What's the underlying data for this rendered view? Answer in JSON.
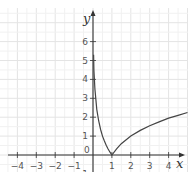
{
  "chart_data": {
    "type": "line",
    "title": "",
    "xlabel": "x",
    "ylabel": "y",
    "xlim": [
      -4.9,
      5.0
    ],
    "ylim": [
      -1.3,
      7.1
    ],
    "grid": true,
    "x_ticks": [
      "-4",
      "-3",
      "-2",
      "-1",
      "1",
      "2",
      "3",
      "4"
    ],
    "y_ticks": [
      "-1",
      "1",
      "2",
      "3",
      "4",
      "5",
      "6"
    ],
    "origin_label": "0",
    "series": [
      {
        "name": "y = |ln x|",
        "x": [
          0.03,
          0.05,
          0.1,
          0.2,
          0.3,
          0.4,
          0.5,
          0.6,
          0.7,
          0.8,
          0.9,
          1.0,
          1.25,
          1.5,
          2.0,
          2.5,
          3.0,
          3.5,
          4.0,
          4.5,
          5.0
        ],
        "values": [
          5.3,
          4.5,
          3.5,
          2.4,
          1.8,
          1.35,
          1.0,
          0.75,
          0.52,
          0.32,
          0.15,
          0.0,
          0.33,
          0.6,
          1.0,
          1.3,
          1.55,
          1.75,
          1.95,
          2.1,
          2.25
        ]
      }
    ]
  },
  "colors": {
    "grid": "#e4e4e4",
    "axis": "#333333",
    "curve": "#444444"
  }
}
